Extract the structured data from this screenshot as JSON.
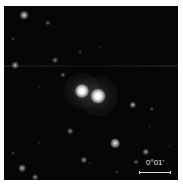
{
  "image": {
    "description": "Astronomical image of a double-nucleus galaxy in a star field",
    "background_color": "#060606",
    "border_color": "#ffffff"
  },
  "scale_bar": {
    "label": "0°01'",
    "x": 135,
    "y": 166,
    "length": 32,
    "label_x": 142,
    "label_y": 153
  },
  "streak": {
    "y": 59
  },
  "nuclei": [
    {
      "x": 78,
      "y": 85,
      "size": 14,
      "halo": 36
    },
    {
      "x": 94,
      "y": 90,
      "size": 15,
      "halo": 40
    }
  ],
  "stars": [
    {
      "x": 20,
      "y": 9,
      "r": 3.2,
      "b": 0.85
    },
    {
      "x": 44,
      "y": 17,
      "r": 2.2,
      "b": 0.5
    },
    {
      "x": 9,
      "y": 33,
      "r": 1.6,
      "b": 0.35
    },
    {
      "x": 11,
      "y": 59,
      "r": 2.8,
      "b": 0.7
    },
    {
      "x": 51,
      "y": 54,
      "r": 2.4,
      "b": 0.55
    },
    {
      "x": 59,
      "y": 69,
      "r": 2.2,
      "b": 0.5
    },
    {
      "x": 76,
      "y": 46,
      "r": 1.6,
      "b": 0.35
    },
    {
      "x": 97,
      "y": 42,
      "r": 1.4,
      "b": 0.3
    },
    {
      "x": 36,
      "y": 82,
      "r": 1.4,
      "b": 0.3
    },
    {
      "x": 129,
      "y": 99,
      "r": 2.6,
      "b": 0.75
    },
    {
      "x": 148,
      "y": 103,
      "r": 1.8,
      "b": 0.45
    },
    {
      "x": 66,
      "y": 125,
      "r": 2.4,
      "b": 0.6
    },
    {
      "x": 111,
      "y": 137,
      "r": 3.6,
      "b": 0.95
    },
    {
      "x": 146,
      "y": 121,
      "r": 1.4,
      "b": 0.3
    },
    {
      "x": 80,
      "y": 154,
      "r": 2.6,
      "b": 0.65
    },
    {
      "x": 142,
      "y": 146,
      "r": 2.6,
      "b": 0.7
    },
    {
      "x": 132,
      "y": 156,
      "r": 2.0,
      "b": 0.5
    },
    {
      "x": 18,
      "y": 162,
      "r": 2.8,
      "b": 0.75
    },
    {
      "x": 31,
      "y": 171,
      "r": 2.4,
      "b": 0.6
    },
    {
      "x": 113,
      "y": 166,
      "r": 1.6,
      "b": 0.35
    },
    {
      "x": 35,
      "y": 137,
      "r": 1.4,
      "b": 0.3
    },
    {
      "x": 9,
      "y": 147,
      "r": 1.6,
      "b": 0.35
    },
    {
      "x": 86,
      "y": 157,
      "r": 1.3,
      "b": 0.3
    },
    {
      "x": 166,
      "y": 140,
      "r": 1.3,
      "b": 0.3
    }
  ]
}
